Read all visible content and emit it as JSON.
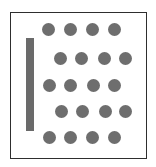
{
  "diagram": {
    "frame": {
      "x": 10,
      "y": 12,
      "width": 137,
      "height": 147,
      "border_color": "#2e2e2e"
    },
    "bar": {
      "x": 26,
      "y": 38,
      "width": 8,
      "height": 93,
      "color": "#6a6a6a"
    },
    "dot_color": "#6e6e6e",
    "dot_diameter": 13,
    "rows": [
      {
        "y": 29,
        "xs": [
          48,
          70,
          92,
          114
        ]
      },
      {
        "y": 58,
        "xs": [
          60,
          81,
          104,
          125
        ]
      },
      {
        "y": 85,
        "xs": [
          49,
          70,
          93,
          114
        ]
      },
      {
        "y": 111,
        "xs": [
          61,
          82,
          105,
          125
        ]
      },
      {
        "y": 137,
        "xs": [
          49,
          70,
          92,
          114
        ]
      }
    ]
  }
}
